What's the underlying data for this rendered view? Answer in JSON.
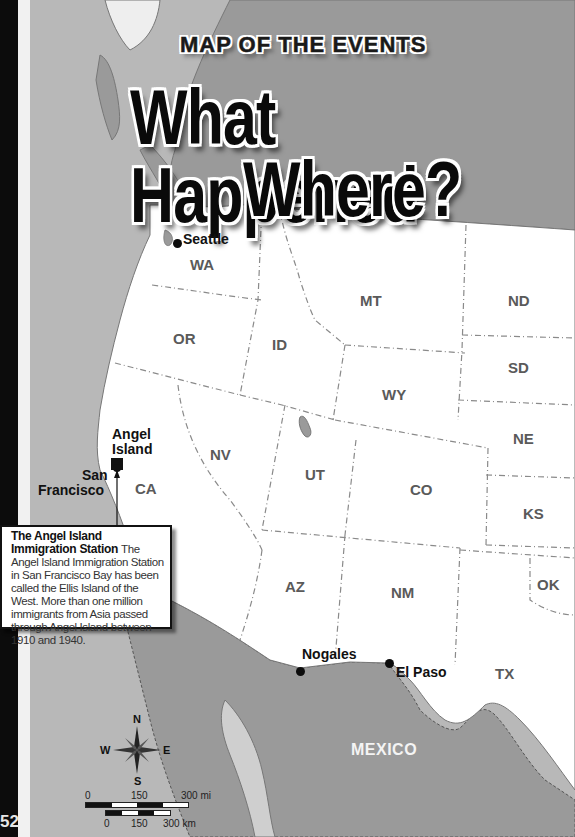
{
  "header": {
    "kicker": "MAP OF THE EVENTS",
    "title_line1": "What Happened",
    "title_line2": "Where?"
  },
  "page_number": "52",
  "states": [
    {
      "abbr": "WA"
    },
    {
      "abbr": "OR"
    },
    {
      "abbr": "ID"
    },
    {
      "abbr": "MT"
    },
    {
      "abbr": "ND"
    },
    {
      "abbr": "SD"
    },
    {
      "abbr": "WY"
    },
    {
      "abbr": "NE"
    },
    {
      "abbr": "NV"
    },
    {
      "abbr": "UT"
    },
    {
      "abbr": "CO"
    },
    {
      "abbr": "KS"
    },
    {
      "abbr": "CA"
    },
    {
      "abbr": "AZ"
    },
    {
      "abbr": "NM"
    },
    {
      "abbr": "OK"
    },
    {
      "abbr": "TX"
    }
  ],
  "cities": {
    "seattle": "Seattle",
    "angel_island_line1": "Angel",
    "angel_island_line2": "Island",
    "san_francisco_line1": "San",
    "san_francisco_line2": "Francisco",
    "nogales": "Nogales",
    "el_paso": "El Paso"
  },
  "countries": {
    "mexico": "MEXICO"
  },
  "callout": {
    "title": "The Angel Island Immigration Station",
    "text": "The Angel Island Immigration Station in San Francisco Bay has been called the Ellis Island of the West. More than one million immigrants from Asia passed through Angel Island between 1910 and 1940."
  },
  "compass": {
    "n": "N",
    "s": "S",
    "e": "E",
    "w": "W"
  },
  "scale": {
    "mi_labels": [
      "0",
      "150",
      "300 mi"
    ],
    "km_labels": [
      "0",
      "150",
      "300 km"
    ]
  },
  "colors": {
    "ocean": "#b8b8b8",
    "us_land": "#ffffff",
    "foreign_land": "#9a9a9a",
    "border": "#7a7a7a",
    "text_dark": "#111111"
  }
}
